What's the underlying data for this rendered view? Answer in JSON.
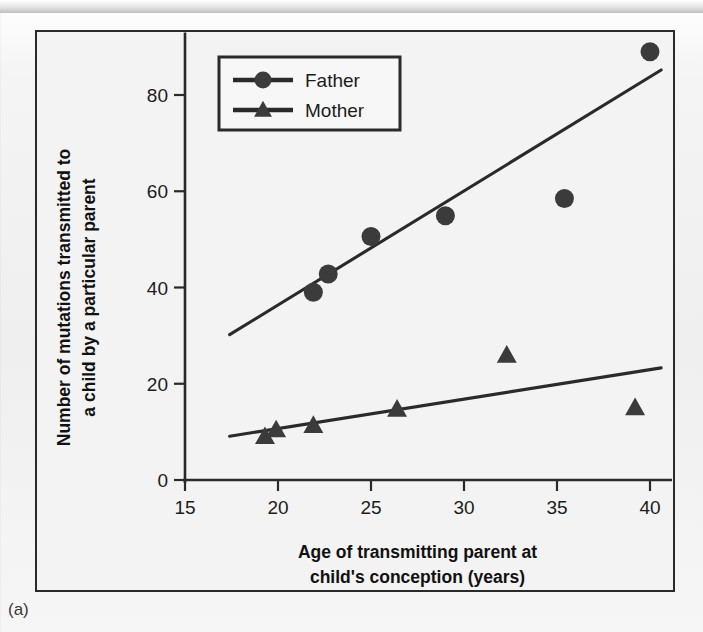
{
  "figure": {
    "panel_caption": "(a)",
    "colors": {
      "ink": "#2a2a2a",
      "marker": "#3b3b3b",
      "paper": "#f3f3f3",
      "frame": "#2a2a2a"
    }
  },
  "chart_data": {
    "type": "scatter",
    "title": "",
    "xlabel_line1": "Age of transmitting parent at",
    "xlabel_line2": "child's conception (years)",
    "ylabel_line1": "Number of mutations transmitted to",
    "ylabel_line2": "a child by a particular parent",
    "xlim": [
      15,
      41.5
    ],
    "ylim": [
      0,
      93
    ],
    "xticks": [
      15,
      20,
      25,
      30,
      35,
      40
    ],
    "xtick_labels": [
      "15",
      "20",
      "25",
      "30",
      "35",
      "40"
    ],
    "yticks": [
      0,
      20,
      40,
      60,
      80
    ],
    "ytick_labels": [
      "0",
      "20",
      "40",
      "60",
      "80"
    ],
    "grid": false,
    "legend_position": "top-left-inside",
    "series": [
      {
        "name": "Father",
        "marker": "circle",
        "points": [
          {
            "x": 21.9,
            "y": 39.0
          },
          {
            "x": 22.7,
            "y": 42.8
          },
          {
            "x": 25.0,
            "y": 50.6
          },
          {
            "x": 29.0,
            "y": 54.9
          },
          {
            "x": 35.4,
            "y": 58.5
          },
          {
            "x": 40.0,
            "y": 89.0
          }
        ],
        "trendline": {
          "x1": 17.4,
          "y1": 30.2,
          "x2": 40.6,
          "y2": 85.2
        }
      },
      {
        "name": "Mother",
        "marker": "triangle",
        "points": [
          {
            "x": 19.3,
            "y": 9.0
          },
          {
            "x": 19.9,
            "y": 10.4
          },
          {
            "x": 21.9,
            "y": 11.3
          },
          {
            "x": 26.4,
            "y": 14.7
          },
          {
            "x": 32.3,
            "y": 25.9
          },
          {
            "x": 39.2,
            "y": 15.0
          }
        ],
        "trendline": {
          "x1": 17.4,
          "y1": 9.1,
          "x2": 40.6,
          "y2": 23.3
        }
      }
    ]
  }
}
